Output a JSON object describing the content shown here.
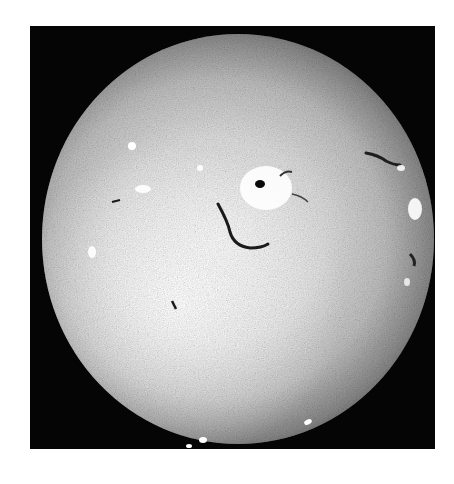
{
  "image": {
    "subject": "solar disk (H-alpha style grayscale photograph)",
    "frame_color": "#050505",
    "background_color": "#ffffff",
    "disk_colors": {
      "center": "#f2f2f2",
      "limb": "#0a0a0a"
    },
    "features": [
      {
        "name": "central-active-region",
        "type": "bright-plage-with-sunspot"
      },
      {
        "name": "curved-filament",
        "type": "dark-filament"
      },
      {
        "name": "northeast-filament",
        "type": "dark-filament"
      },
      {
        "name": "east-limb-bright-region",
        "type": "bright-plage"
      },
      {
        "name": "west-bright-spots",
        "type": "bright-plage"
      },
      {
        "name": "south-limb-bright-spots",
        "type": "bright-plage"
      }
    ]
  }
}
